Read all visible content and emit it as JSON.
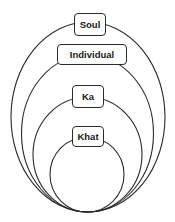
{
  "diagram": {
    "type": "nested-ellipses",
    "stroke_color": "#2b2b2b",
    "layers": [
      {
        "label": "Soul",
        "level": 1
      },
      {
        "label": "Individual",
        "level": 2
      },
      {
        "label": "Ka",
        "level": 3
      },
      {
        "label": "Khat",
        "level": 4
      }
    ]
  }
}
